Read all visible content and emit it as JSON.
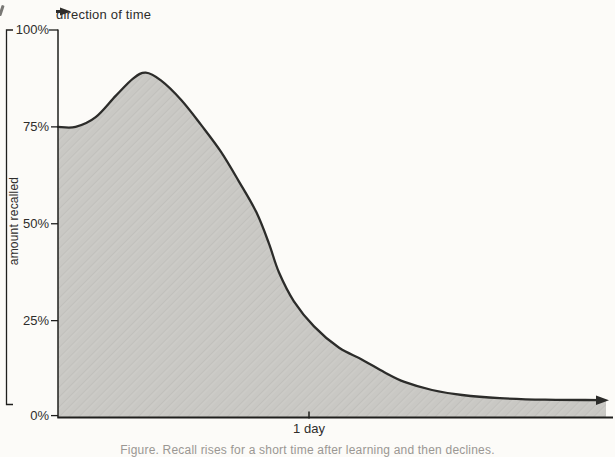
{
  "figure": {
    "direction_label": "direction of time",
    "y_axis_label": "amount recalled",
    "caption_partial": "Figure. Recall rises for a short time after learning and then declines."
  },
  "colors": {
    "background": "#fcfbf8",
    "area_fill": "#c9c8c4",
    "area_texture": "#c1c0bc",
    "curve_line": "#2c2c2a",
    "axis_line": "#1f1f1d",
    "label_text": "#2e2d2b",
    "caption_text": "#9a9793"
  },
  "icons": {
    "direction_arrow": "solid-right-triangle",
    "curve_end_arrow": "solid-right-triangle"
  },
  "chart_data": {
    "type": "area",
    "title": "",
    "xlabel": "direction of time",
    "ylabel": "amount recalled",
    "x_unit": "days",
    "xlim": [
      0,
      2.21
    ],
    "ylim": [
      0,
      100
    ],
    "grid": false,
    "legend": "none",
    "x_ticks": [
      {
        "label": "1 day",
        "value": 1
      }
    ],
    "y_ticks": [
      {
        "label": "100%",
        "value": 100
      },
      {
        "label": "75%",
        "value": 75
      },
      {
        "label": "50%",
        "value": 50
      },
      {
        "label": "25%",
        "value": 25
      },
      {
        "label": "0%",
        "value": 0
      }
    ],
    "points": [
      {
        "t": 0.0,
        "pct": 75.0
      },
      {
        "t": 0.07,
        "pct": 75.0
      },
      {
        "t": 0.15,
        "pct": 77.5
      },
      {
        "t": 0.23,
        "pct": 83.0
      },
      {
        "t": 0.3,
        "pct": 87.5
      },
      {
        "t": 0.35,
        "pct": 89.0
      },
      {
        "t": 0.41,
        "pct": 87.0
      },
      {
        "t": 0.49,
        "pct": 82.0
      },
      {
        "t": 0.57,
        "pct": 75.5
      },
      {
        "t": 0.65,
        "pct": 68.5
      },
      {
        "t": 0.72,
        "pct": 61.0
      },
      {
        "t": 0.79,
        "pct": 53.0
      },
      {
        "t": 0.84,
        "pct": 45.0
      },
      {
        "t": 0.88,
        "pct": 37.5
      },
      {
        "t": 0.94,
        "pct": 30.0
      },
      {
        "t": 1.02,
        "pct": 23.5
      },
      {
        "t": 1.12,
        "pct": 18.0
      },
      {
        "t": 1.21,
        "pct": 15.0
      },
      {
        "t": 1.3,
        "pct": 11.7
      },
      {
        "t": 1.38,
        "pct": 9.2
      },
      {
        "t": 1.49,
        "pct": 7.1
      },
      {
        "t": 1.61,
        "pct": 5.8
      },
      {
        "t": 1.76,
        "pct": 5.0
      },
      {
        "t": 1.94,
        "pct": 4.6
      },
      {
        "t": 2.16,
        "pct": 4.5
      }
    ],
    "annotations": [
      "peak of ~89% shortly after learning (reminiscence bump)",
      "curve starts at 75% on the y-axis",
      "curve flattens to ~4-5% and ends in a right-pointing arrow"
    ]
  }
}
